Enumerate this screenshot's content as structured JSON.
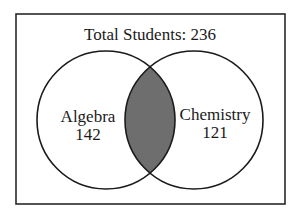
{
  "diagram": {
    "type": "venn",
    "title": "Total Students: 236",
    "sets": [
      {
        "label": "Algebra",
        "value": "142"
      },
      {
        "label": "Chemistry",
        "value": "121"
      }
    ],
    "intersection": {
      "shaded": true,
      "fill": "#6e6e6e"
    },
    "colors": {
      "stroke": "#1a1a1a",
      "background": "#ffffff",
      "intersection": "#6e6e6e"
    }
  }
}
